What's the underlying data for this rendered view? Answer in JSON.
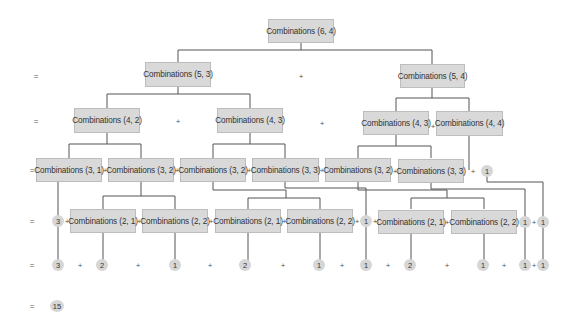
{
  "diagram": {
    "node_color": "#d9d9d9",
    "line_color": "#555555",
    "rows": [
      {
        "level": 0,
        "nodes": [
          {
            "label": "Combinations (6, 4)"
          }
        ]
      },
      {
        "level": 1,
        "prefix": "=",
        "nodes": [
          {
            "label": "Combinations (5, 3)"
          },
          {
            "label": "Combinations (5, 4)"
          }
        ],
        "ops": [
          "+"
        ]
      },
      {
        "level": 2,
        "prefix": "=",
        "nodes": [
          {
            "label": "Combinations (4, 2)"
          },
          {
            "label": "Combinations (4, 3)"
          },
          {
            "label": "Combinations (4, 3)"
          },
          {
            "label": "Combinations (4, 4)"
          }
        ],
        "ops": [
          "+",
          "+",
          "+"
        ]
      },
      {
        "level": 3,
        "prefix": "=",
        "nodes": [
          {
            "label": "Combinations (3, 1)"
          },
          {
            "label": "Combinations (3, 2)"
          },
          {
            "label": "Combinations (3, 2)"
          },
          {
            "label": "Combinations (3, 3)"
          },
          {
            "label": "Combinations (3, 2)"
          },
          {
            "label": "Combinations (3, 3)"
          },
          {
            "value": "1"
          }
        ],
        "ops": [
          "+",
          "+",
          "+",
          "+",
          "+",
          "+"
        ]
      },
      {
        "level": 4,
        "prefix": "=",
        "nodes": [
          {
            "value": "3"
          },
          {
            "label": "Combinations (2, 1)"
          },
          {
            "label": "Combinations (2, 2)"
          },
          {
            "label": "Combinations (2, 1)"
          },
          {
            "label": "Combinations (2, 2)"
          },
          {
            "value": "1"
          },
          {
            "label": "Combinations (2, 1)"
          },
          {
            "label": "Combinations (2, 2)"
          },
          {
            "value": "1"
          },
          {
            "value": "1"
          }
        ],
        "ops": [
          "+",
          "+",
          "+",
          "+",
          "+",
          "+",
          "+",
          "+",
          "+"
        ]
      },
      {
        "level": 5,
        "prefix": "=",
        "values": [
          "3",
          "2",
          "1",
          "2",
          "1",
          "1",
          "2",
          "1",
          "1",
          "1"
        ],
        "ops": [
          "+",
          "+",
          "+",
          "+",
          "+",
          "+",
          "+",
          "+",
          "+"
        ]
      },
      {
        "level": 6,
        "prefix": "=",
        "values": [
          "15"
        ]
      }
    ]
  }
}
